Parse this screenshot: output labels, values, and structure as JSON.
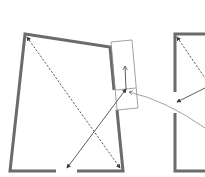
{
  "diagram": {
    "title": "",
    "type": "floor-plan-sketch",
    "colors": {
      "wall": "#6b6b6b",
      "line": "#4a4a4a",
      "box": "#8a8a8a",
      "background": "#ffffff"
    },
    "rooms": [
      {
        "name": "left-room",
        "has_bottom_opening": true,
        "has_right_wall_opening": true
      },
      {
        "name": "right-room",
        "partially_visible": true,
        "has_left_wall_opening": true
      }
    ],
    "elements": [
      "dashed diagonal arrow (top-left to bottom-right) in left room",
      "solid diagonal arrow from bottom opening to box",
      "rotated rectangle on right wall with upward arrow",
      "curved connector from right room to box",
      "dashed and solid arrows in right room"
    ]
  }
}
